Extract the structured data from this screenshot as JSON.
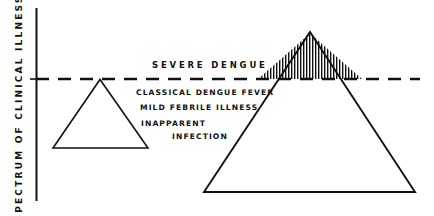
{
  "figure": {
    "axis": {
      "title": "SPECTRUM OF CLINICAL ILLNESS",
      "line_color": "#111111"
    },
    "threshold": {
      "name": "severity-threshold-dashed-line",
      "color": "#111111",
      "dash": "13 9",
      "y": 79
    },
    "labels": {
      "severe": "SEVERE DENGUE",
      "classical": "CLASSICAL DENGUE FEVER",
      "mild": "MILD FEBRILE ILLNESS",
      "inapparent": "INAPPARENT",
      "infection": "INFECTION"
    },
    "triangles": [
      {
        "name": "small-triangle",
        "points": "53,148 100,79.5 148,148",
        "fill": "none",
        "stroke": "#111111",
        "stroke_width": 1.6
      },
      {
        "name": "large-triangle",
        "points": "204,192 310,32 415,192",
        "fill": "none",
        "stroke": "#111111",
        "stroke_width": 1.9
      }
    ],
    "hatched_region": {
      "name": "severe-dengue-hatched-apex",
      "points": "258,79 310,33.5 362,79",
      "pattern": "vertical-lines",
      "line_color": "#111111",
      "line_spacing": 3,
      "line_width": 1.4
    },
    "colors": {
      "ink": "#111111",
      "background": "#ffffff"
    }
  }
}
